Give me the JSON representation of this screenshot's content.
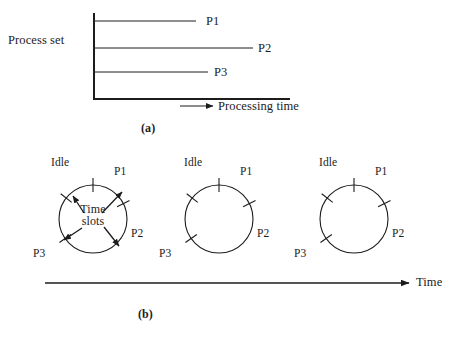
{
  "figure": {
    "width": 460,
    "height": 340,
    "background": "#ffffff",
    "stroke_color": "#1c1c1c"
  },
  "panel_a": {
    "caption": "(a)",
    "y_axis_label": "Process set",
    "x_axis_label": "Processing time",
    "axis": {
      "origin_x": 94,
      "origin_y": 99,
      "top_y": 13,
      "right_x": 290
    },
    "processes": [
      {
        "name": "P1",
        "line_y": 21,
        "line_end_x": 196,
        "label_x": 206,
        "label_y": 15
      },
      {
        "name": "P2",
        "line_y": 48,
        "line_end_x": 253,
        "label_x": 258,
        "label_y": 42
      },
      {
        "name": "P3",
        "line_y": 72,
        "line_end_x": 208,
        "label_x": 214,
        "label_y": 66
      }
    ],
    "x_arrow": {
      "start_x": 180,
      "end_x": 213,
      "y": 106
    },
    "x_label_x": 218,
    "x_label_y": 100
  },
  "panel_b": {
    "caption": "(b)",
    "time_axis_label": "Time",
    "time_arrow": {
      "start_x": 45,
      "end_x": 409,
      "y": 283
    },
    "annotation": {
      "line1": "Time",
      "line2": "slots"
    },
    "circles": [
      {
        "id": "circle-1",
        "cx": 93,
        "cy": 219,
        "r": 34,
        "has_annotation": true,
        "ticks": [
          {
            "name": "idle-tick",
            "angle_deg": 90
          },
          {
            "name": "p1-tick",
            "angle_deg": 27
          },
          {
            "name": "p2-tick",
            "angle_deg": 215
          },
          {
            "name": "p3-tick",
            "angle_deg": 142
          }
        ],
        "labels": [
          {
            "name": "Idle",
            "x": 51,
            "y": 157
          },
          {
            "name": "P1",
            "x": 114,
            "y": 166
          },
          {
            "name": "P2",
            "x": 131,
            "y": 228
          },
          {
            "name": "P3",
            "x": 33,
            "y": 248
          }
        ],
        "arrows": [
          {
            "name": "arrow-idle",
            "x1": 84,
            "y1": 213,
            "x2": 73,
            "y2": 196
          },
          {
            "name": "arrow-p1",
            "x1": 102,
            "y1": 213,
            "x2": 122,
            "y2": 192
          },
          {
            "name": "arrow-p2",
            "x1": 104,
            "y1": 227,
            "x2": 119,
            "y2": 246
          },
          {
            "name": "arrow-p3",
            "x1": 82,
            "y1": 228,
            "x2": 64,
            "y2": 240
          }
        ]
      },
      {
        "id": "circle-2",
        "cx": 219,
        "cy": 219,
        "r": 34,
        "has_annotation": false,
        "ticks": [
          {
            "name": "idle-tick",
            "angle_deg": 90
          },
          {
            "name": "p1-tick",
            "angle_deg": 27
          },
          {
            "name": "p2-tick",
            "angle_deg": 215
          },
          {
            "name": "p3-tick",
            "angle_deg": 142
          }
        ],
        "labels": [
          {
            "name": "Idle",
            "x": 184,
            "y": 157
          },
          {
            "name": "P1",
            "x": 240,
            "y": 166
          },
          {
            "name": "P2",
            "x": 257,
            "y": 228
          },
          {
            "name": "P3",
            "x": 159,
            "y": 248
          }
        ],
        "arrows": []
      },
      {
        "id": "circle-3",
        "cx": 354,
        "cy": 219,
        "r": 34,
        "has_annotation": false,
        "ticks": [
          {
            "name": "idle-tick",
            "angle_deg": 90
          },
          {
            "name": "p1-tick",
            "angle_deg": 27
          },
          {
            "name": "p2-tick",
            "angle_deg": 215
          },
          {
            "name": "p3-tick",
            "angle_deg": 142
          }
        ],
        "labels": [
          {
            "name": "Idle",
            "x": 319,
            "y": 157
          },
          {
            "name": "P1",
            "x": 375,
            "y": 166
          },
          {
            "name": "P2",
            "x": 392,
            "y": 228
          },
          {
            "name": "P3",
            "x": 294,
            "y": 248
          }
        ],
        "arrows": []
      }
    ]
  },
  "captions": {
    "a_x": 141,
    "a_y": 122,
    "b_x": 138,
    "b_y": 308
  }
}
